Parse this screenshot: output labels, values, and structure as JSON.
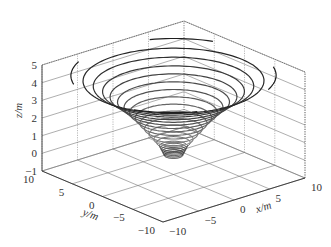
{
  "chart_data": {
    "type": "contour3d",
    "title": "",
    "xlabel": "x/m",
    "ylabel": "y/m",
    "zlabel": "z/m",
    "xlim": [
      -10,
      10
    ],
    "ylim": [
      -10,
      10
    ],
    "zlim": [
      -1,
      5
    ],
    "x_ticks": [
      "-10",
      "-5",
      "0",
      "5",
      "10"
    ],
    "y_ticks": [
      "-10",
      "-5",
      "0",
      "5",
      "10"
    ],
    "z_ticks": [
      "-1",
      "0",
      "1",
      "2",
      "3",
      "4",
      "5"
    ],
    "grid": true,
    "box": true,
    "contour_levels_z": [
      0.1,
      0.2,
      0.3,
      0.4,
      0.5,
      0.6,
      0.8,
      1.0,
      1.3,
      1.6,
      1.9,
      2.2,
      2.5,
      2.8,
      3.1,
      3.4,
      3.7,
      4.0,
      4.3,
      4.6
    ],
    "ring_radius_m": [
      1.0,
      1.1,
      1.2,
      1.3,
      1.4,
      1.5,
      1.8,
      2.1,
      2.6,
      3.1,
      3.6,
      4.1,
      4.7,
      5.3,
      6.0,
      6.8,
      7.6,
      8.6,
      9.7,
      11.0
    ],
    "colormap": "gray"
  }
}
